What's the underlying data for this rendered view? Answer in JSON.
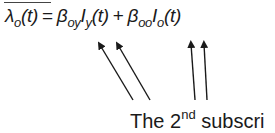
{
  "formula": {
    "lhs_symbol": "λ",
    "lhs_sub": "o",
    "lhs_arg": "(t)",
    "equals": "=",
    "term1_coef": "β",
    "term1_coef_sub": "oy",
    "term1_var": "I",
    "term1_var_sub": "y",
    "term1_arg": "(t)",
    "plus": "+",
    "term2_coef": "β",
    "term2_coef_sub": "oo",
    "term2_var": "I",
    "term2_var_sub": "o",
    "term2_arg": "(t)"
  },
  "caption": {
    "prefix": "The 2",
    "superscript": "nd",
    "suffix": " subscri"
  },
  "arrows": [
    {
      "name": "arrow-to-oy-subscript-1",
      "from": [
        133,
        100
      ],
      "to": [
        98,
        42
      ]
    },
    {
      "name": "arrow-to-oy-subscript-2",
      "from": [
        150,
        100
      ],
      "to": [
        116,
        42
      ]
    },
    {
      "name": "arrow-to-oo-subscript-1",
      "from": [
        195,
        100
      ],
      "to": [
        191,
        41
      ]
    },
    {
      "name": "arrow-to-oo-subscript-2",
      "from": [
        207,
        100
      ],
      "to": [
        204,
        41
      ]
    }
  ],
  "colors": {
    "ink": "#1a1a1a",
    "background": "#ffffff"
  }
}
